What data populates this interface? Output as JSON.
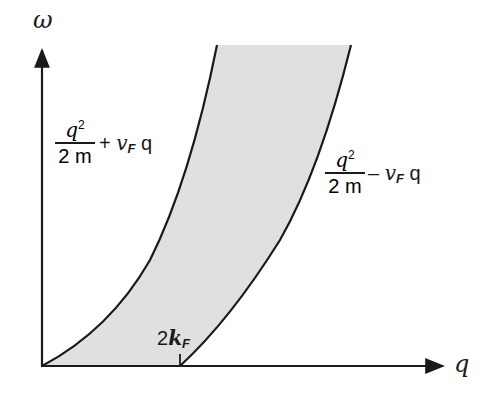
{
  "diagram": {
    "type": "dispersion / particle-hole continuum",
    "axes": {
      "y_label": "ω",
      "x_label": "q"
    },
    "curves": {
      "upper": {
        "numerator": "q",
        "numerator_power": "2",
        "denominator": "2 m",
        "operator": "+",
        "velocity": "v",
        "velocity_sub": "F",
        "tail": "q"
      },
      "lower": {
        "numerator": "q",
        "numerator_power": "2",
        "denominator": "2 m",
        "operator": "–",
        "velocity": "v",
        "velocity_sub": "F",
        "tail": "q"
      }
    },
    "tick": {
      "prefix": "2",
      "symbol": "k",
      "sub": "F"
    },
    "colors": {
      "fill": "#e0e0e0",
      "line": "#1a1a1a"
    }
  }
}
